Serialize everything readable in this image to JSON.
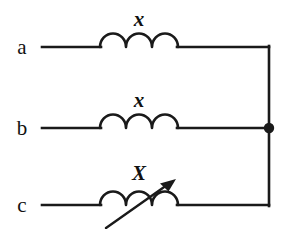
{
  "figure": {
    "background_color": "#ffffff",
    "line_color": "#1a1a1a",
    "width": 288,
    "height": 229
  },
  "terminals": [
    {
      "id": "a",
      "label": "a",
      "x": 22,
      "y": 54,
      "wire_y": 47
    },
    {
      "id": "b",
      "label": "b",
      "x": 22,
      "y": 135,
      "wire_y": 128
    },
    {
      "id": "c",
      "label": "c",
      "x": 22,
      "y": 212,
      "wire_y": 205
    }
  ],
  "components": [
    {
      "id": "reactor-a",
      "type": "inductor",
      "label": "x",
      "label_x": 139,
      "label_y": 26,
      "coil_start_x": 100,
      "coil_end_x": 178,
      "coil_y": 47,
      "arcs": 3,
      "variable": false
    },
    {
      "id": "reactor-b",
      "type": "inductor",
      "label": "x",
      "label_x": 139,
      "label_y": 107,
      "coil_start_x": 100,
      "coil_end_x": 178,
      "coil_y": 128,
      "arcs": 3,
      "variable": false
    },
    {
      "id": "reactor-c",
      "type": "variable-inductor",
      "label": "X",
      "label_x": 139,
      "label_y": 180,
      "coil_start_x": 100,
      "coil_end_x": 178,
      "coil_y": 205,
      "arcs": 3,
      "variable": true,
      "arrow_from_x": 106,
      "arrow_from_y": 228,
      "arrow_to_x": 174,
      "arrow_to_y": 180
    }
  ],
  "bus": {
    "id": "common-bus",
    "x": 269,
    "top_y": 47,
    "bottom_y": 205
  },
  "junction": {
    "id": "bus-node-b",
    "x": 269,
    "y": 128,
    "radius": 5.2
  },
  "wires": [
    {
      "id": "lead-a-left",
      "x1": 42,
      "y1": 47,
      "x2": 100,
      "y2": 47
    },
    {
      "id": "lead-a-right",
      "x1": 178,
      "y1": 47,
      "x2": 269,
      "y2": 47
    },
    {
      "id": "lead-b-left",
      "x1": 42,
      "y1": 128,
      "x2": 100,
      "y2": 128
    },
    {
      "id": "lead-b-right",
      "x1": 178,
      "y1": 128,
      "x2": 269,
      "y2": 128
    },
    {
      "id": "lead-c-left",
      "x1": 42,
      "y1": 205,
      "x2": 100,
      "y2": 205
    },
    {
      "id": "lead-c-right",
      "x1": 178,
      "y1": 205,
      "x2": 269,
      "y2": 205
    }
  ]
}
